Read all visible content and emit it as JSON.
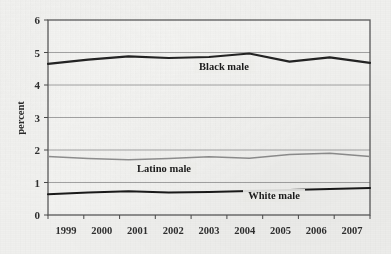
{
  "chart_data": {
    "type": "line",
    "title": "",
    "xlabel": "",
    "ylabel": "percent",
    "x": [
      "1999",
      "2000",
      "2001",
      "2002",
      "2003",
      "2004",
      "2005",
      "2006",
      "2007"
    ],
    "categories": [
      "1999",
      "2000",
      "2001",
      "2002",
      "2003",
      "2004",
      "2005",
      "2006",
      "2007"
    ],
    "ylim": [
      0,
      6
    ],
    "xlim_labels": [
      "1999",
      "2007"
    ],
    "y_ticks": [
      "0",
      "1",
      "2",
      "3",
      "4",
      "5",
      "6"
    ],
    "grid": "horizontal",
    "legend_position": "inline-annotations",
    "series": [
      {
        "name": "Black male",
        "color": "#232323",
        "line_width": 2.1,
        "values": [
          4.65,
          4.78,
          4.88,
          4.83,
          4.86,
          4.97,
          4.72,
          4.85,
          4.68
        ]
      },
      {
        "name": "Latino male",
        "color": "#8f8f8f",
        "line_width": 1.5,
        "values": [
          1.8,
          1.74,
          1.7,
          1.74,
          1.79,
          1.75,
          1.86,
          1.9,
          1.8
        ]
      },
      {
        "name": "White male",
        "color": "#1a1a1a",
        "line_width": 2.1,
        "values": [
          0.64,
          0.69,
          0.73,
          0.69,
          0.71,
          0.74,
          0.77,
          0.8,
          0.83
        ]
      }
    ],
    "annotations": [
      {
        "text": "Black male",
        "x_pixel": 224,
        "y_pixel": 70
      },
      {
        "text": "Latino male",
        "x_pixel": 164,
        "y_pixel": 172
      },
      {
        "text": "White male",
        "x_pixel": 274,
        "y_pixel": 199
      }
    ]
  },
  "axis": {
    "y_title": "percent",
    "y_tick_0": "0",
    "y_tick_1": "1",
    "y_tick_2": "2",
    "y_tick_3": "3",
    "y_tick_4": "4",
    "y_tick_5": "5",
    "y_tick_6": "6",
    "x_tick_1999": "1999",
    "x_tick_2000": "2000",
    "x_tick_2001": "2001",
    "x_tick_2002": "2002",
    "x_tick_2003": "2003",
    "x_tick_2004": "2004",
    "x_tick_2005": "2005",
    "x_tick_2006": "2006",
    "x_tick_2007": "2007"
  },
  "colors": {
    "background": "#f2f2f0",
    "plot_border": "#5a5a5a",
    "gridline": "#9a9a9a",
    "black_male": "#232323",
    "latino_male": "#8f8f8f",
    "white_male": "#1a1a1a"
  }
}
